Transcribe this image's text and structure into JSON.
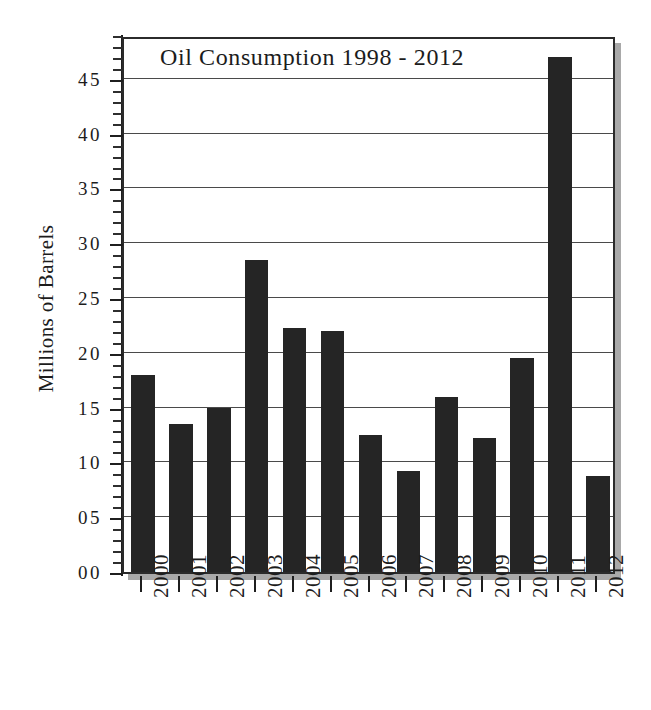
{
  "chart_data": {
    "type": "bar",
    "title": "Oil Consumption 1998 - 2012",
    "xlabel": "",
    "ylabel": "Millions of Barrels",
    "categories": [
      "2000",
      "2001",
      "2002",
      "2003",
      "2004",
      "2005",
      "2006",
      "2007",
      "2008",
      "2009",
      "2010",
      "2011",
      "2012"
    ],
    "values": [
      18.0,
      13.5,
      15.0,
      28.5,
      22.3,
      22.0,
      12.5,
      9.2,
      16.0,
      12.2,
      19.5,
      47.0,
      8.8
    ],
    "ylim": [
      0,
      49
    ],
    "ytick_values": [
      0,
      5,
      10,
      15,
      20,
      25,
      30,
      35,
      40,
      45
    ],
    "ytick_labels": [
      "00",
      "05",
      "10",
      "15",
      "20",
      "25",
      "30",
      "35",
      "40",
      "45"
    ],
    "yminor_step": 1,
    "grid": true,
    "grid_axis": "y",
    "legend": false,
    "bar_color": "#252525",
    "axis_color": "#1f1f1f",
    "grid_color": "#4a4a4a",
    "background": "#ffffff",
    "shadow_color": "#a9a9a9"
  }
}
